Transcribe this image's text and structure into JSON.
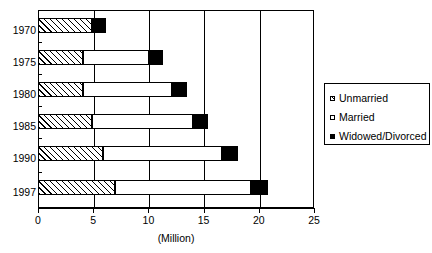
{
  "chart_data": {
    "type": "bar",
    "orientation": "horizontal",
    "stacked": true,
    "title": "",
    "xlabel": "(Million)",
    "ylabel": "",
    "xlim": [
      0,
      25
    ],
    "xticks": [
      0,
      5,
      10,
      15,
      20,
      25
    ],
    "xtick_labels": [
      "0",
      "5",
      "10",
      "15",
      "20",
      "25"
    ],
    "grid": "vertical",
    "categories": [
      "1970",
      "1975",
      "1980",
      "1985",
      "1990",
      "1997"
    ],
    "series": [
      {
        "name": "Unmarried",
        "values": [
          4.9,
          4.1,
          4.1,
          4.9,
          5.9,
          7.0
        ]
      },
      {
        "name": "Married",
        "values": [
          0.0,
          6.0,
          8.0,
          9.1,
          10.8,
          12.3
        ]
      },
      {
        "name": "Widowed/Divorced",
        "values": [
          1.3,
          1.2,
          1.4,
          1.4,
          1.4,
          1.5
        ]
      }
    ],
    "totals": [
      6.2,
      11.3,
      13.5,
      15.4,
      18.1,
      20.8
    ],
    "legend": {
      "position": "right",
      "entries": [
        {
          "label": "Unmarried",
          "swatch": "hatched"
        },
        {
          "label": "Married",
          "swatch": "white"
        },
        {
          "label": "Widowed/Divorced",
          "swatch": "black"
        }
      ]
    },
    "colors": {
      "line": "#000000",
      "unmarried_fill": "#ffffff",
      "married_fill": "#ffffff",
      "widowed_fill": "#000000",
      "background": "#ffffff"
    }
  }
}
